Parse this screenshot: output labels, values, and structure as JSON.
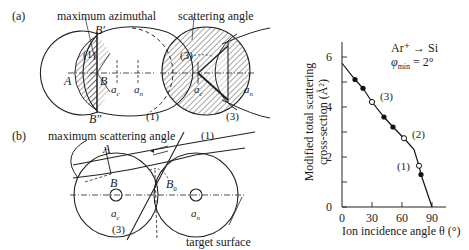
{
  "figure": {
    "panel_a": {
      "label": "(a)",
      "annotation_left": "maximum azimuthal",
      "annotation_right": "scattering angle",
      "points": {
        "A": "A",
        "B": "B",
        "B_prime": "B′",
        "B_double_prime": "B″"
      },
      "markers": {
        "one_top": "(1)",
        "one_bottom": "(1)",
        "three_top": "(3)",
        "three_bottom": "(3)"
      },
      "atoms": {
        "ac": "a",
        "ac_sub": "c",
        "an": "a",
        "an_sub": "n",
        "an2": "a",
        "an2_sub": "n",
        "ac2": "a",
        "ac2_sub": "c"
      }
    },
    "panel_b": {
      "label": "(b)",
      "annotation": "maximum scattering angle",
      "points": {
        "A": "A",
        "B": "B",
        "B0": "B",
        "B0_sub": "0"
      },
      "markers": {
        "one": "(1)",
        "three": "(3)"
      },
      "atoms": {
        "ac": "a",
        "ac_sub": "c",
        "an": "a",
        "an_sub": "n"
      },
      "surface_label": "target surface"
    }
  },
  "chart_data": {
    "type": "line",
    "title": "",
    "legend": {
      "line1": "Ar⁺ → Si",
      "line2": "φ",
      "line2_sub": "min",
      "line2_rest": " = 2°"
    },
    "xlabel": "Ion incidence angle θ (°)",
    "ylabel_line1": "Modified total scattering",
    "ylabel_line2": "cross-section (Å²)",
    "xlim": [
      0,
      100
    ],
    "ylim": [
      0,
      6.5
    ],
    "x_ticks": [
      0,
      30,
      60,
      90
    ],
    "y_ticks": [
      0,
      2,
      4,
      6
    ],
    "grid": false,
    "series": [
      {
        "name": "curve",
        "x": [
          0,
          13,
          21,
          30,
          42,
          51,
          62,
          72,
          77,
          79,
          90
        ],
        "y": [
          5.75,
          5.1,
          4.75,
          4.2,
          3.6,
          3.2,
          2.75,
          2.3,
          1.65,
          1.3,
          0.0
        ]
      },
      {
        "name": "filled points",
        "marker": "filled-circle",
        "x": [
          13,
          21,
          42,
          51,
          79
        ],
        "y": [
          5.1,
          4.75,
          3.6,
          3.2,
          1.3
        ]
      },
      {
        "name": "open points",
        "marker": "open-circle",
        "x": [
          30,
          62,
          77
        ],
        "y": [
          4.2,
          2.75,
          1.65
        ],
        "labels": [
          "(3)",
          "(2)",
          "(1)"
        ]
      }
    ]
  }
}
